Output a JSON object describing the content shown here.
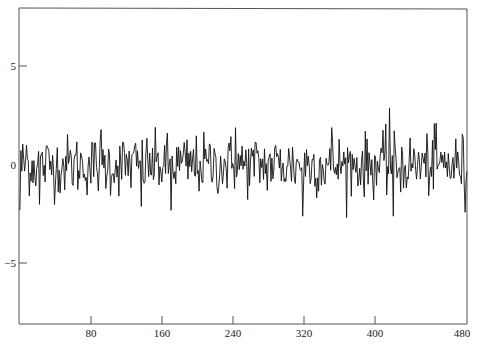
{
  "chart_data": {
    "type": "line",
    "title": "",
    "xlabel": "",
    "ylabel": "",
    "xlim": [
      0,
      480
    ],
    "ylim": [
      -8,
      8
    ],
    "grid": false,
    "legend": null,
    "x_ticks": [
      80,
      160,
      240,
      320,
      400,
      480
    ],
    "x_tick_labels": [
      "80",
      "160",
      "240",
      "320",
      "400",
      "480"
    ],
    "y_ticks": [
      5,
      0,
      -5
    ],
    "y_tick_labels": [
      "5",
      "0",
      "−5"
    ],
    "series": [
      {
        "name": "white noise",
        "n_points": 480,
        "x_start": 1,
        "x_end": 480,
        "description": "Gaussian white noise series centered at 0",
        "mean": 0,
        "std_dev": 0.9,
        "approx_range": [
          -2.9,
          2.9
        ],
        "color": "#111111",
        "notable_points": [
          {
            "x": 1,
            "y": -2.3
          },
          {
            "x": 8,
            "y": 1.0
          },
          {
            "x": 22,
            "y": -2.0
          },
          {
            "x": 88,
            "y": 1.8
          },
          {
            "x": 131,
            "y": -2.1
          },
          {
            "x": 163,
            "y": -2.3
          },
          {
            "x": 232,
            "y": 1.9
          },
          {
            "x": 304,
            "y": -2.6
          },
          {
            "x": 335,
            "y": 1.9
          },
          {
            "x": 397,
            "y": 2.9
          },
          {
            "x": 401,
            "y": -2.6
          },
          {
            "x": 445,
            "y": 2.1
          },
          {
            "x": 478,
            "y": -2.4
          }
        ]
      }
    ]
  },
  "axes": {
    "x_labels": [
      "80",
      "160",
      "240",
      "320",
      "400",
      "480"
    ],
    "y_labels": [
      "5",
      "0",
      "−5"
    ]
  }
}
